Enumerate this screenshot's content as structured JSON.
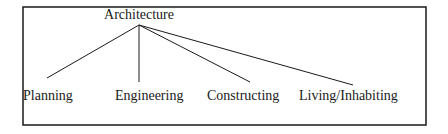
{
  "diagram": {
    "root": {
      "label": "Architecture",
      "x": 139,
      "y": 19,
      "anchor_x": 139,
      "anchor_y": 25
    },
    "children": [
      {
        "label": "Planning",
        "text_x": 23,
        "text_y": 100,
        "line_end_x": 47,
        "line_end_y": 78
      },
      {
        "label": "Engineering",
        "text_x": 115,
        "text_y": 100,
        "line_end_x": 139,
        "line_end_y": 82
      },
      {
        "label": "Constructing",
        "text_x": 207,
        "text_y": 100,
        "line_end_x": 250,
        "line_end_y": 82
      },
      {
        "label": "Living/Inhabiting",
        "text_x": 299,
        "text_y": 100,
        "line_end_x": 353,
        "line_end_y": 85
      }
    ],
    "frame": {
      "x": 23,
      "y": 7,
      "width": 403,
      "height": 118
    },
    "colors": {
      "line": "#1a1a1a",
      "text": "#1a1a1a",
      "background": "#ffffff"
    }
  }
}
